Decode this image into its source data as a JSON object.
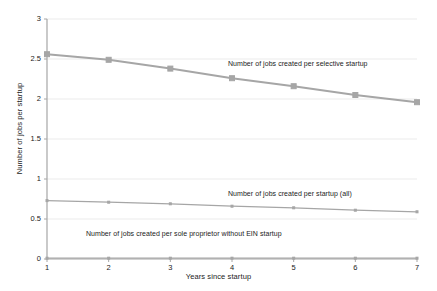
{
  "chart_data": {
    "type": "line",
    "title": "",
    "xlabel": "Years since startup",
    "ylabel": "Number of jobs per startup",
    "x": [
      1,
      2,
      3,
      4,
      5,
      6,
      7
    ],
    "xlim": [
      1,
      7
    ],
    "ylim": [
      0,
      3
    ],
    "xticks": [
      "1",
      "2",
      "3",
      "4",
      "5",
      "6",
      "7"
    ],
    "yticks": [
      "0",
      "0.5",
      "1",
      "1.5",
      "2",
      "2.5",
      "3"
    ],
    "ytick_values": [
      0,
      0.5,
      1,
      1.5,
      2,
      2.5,
      3
    ],
    "grid": true,
    "legend_position": "inline-annotations",
    "series": [
      {
        "name": "Number of jobs created per selective startup",
        "values": [
          2.56,
          2.49,
          2.38,
          2.26,
          2.16,
          2.05,
          1.96
        ],
        "color": "#a6a6a6",
        "marker": "square"
      },
      {
        "name": "Number of jobs created per startup (all)",
        "values": [
          0.73,
          0.71,
          0.69,
          0.66,
          0.64,
          0.61,
          0.59
        ],
        "color": "#a6a6a6",
        "marker": "small-square"
      },
      {
        "name": "Number of jobs created per sole proprietor without EIN startup",
        "values": [
          0.01,
          0.01,
          0.01,
          0.01,
          0.01,
          0.01,
          0.01
        ],
        "color": "#a6a6a6",
        "marker": "small-square"
      }
    ],
    "annotations": [
      {
        "text": "Number of jobs created per selective startup",
        "x_px": 228,
        "y_px": 60
      },
      {
        "text": "Number of jobs created per startup (all)",
        "x_px": 228,
        "y_px": 190
      },
      {
        "text": "Number of jobs created per sole proprietor without EIN startup",
        "x_px": 86,
        "y_px": 230
      }
    ]
  },
  "axes": {
    "x_title": "Years since startup",
    "y_title": "Number of jobs per startup"
  },
  "colors": {
    "line": "#a6a6a6",
    "axis": "#a6a6a6",
    "grid": "#ebebeb",
    "text": "#1b1b1b",
    "background": "#ffffff"
  }
}
